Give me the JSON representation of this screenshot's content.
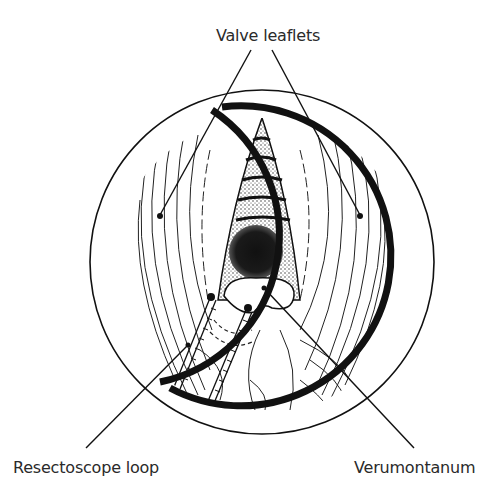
{
  "figure": {
    "type": "endoscopic view illustration",
    "labels": {
      "top": "Valve leaflets",
      "bottom_left": "Resectoscope loop",
      "bottom_right": "Verumontanum"
    },
    "colors": {
      "ink": "#111111",
      "background": "#ffffff",
      "label_text": "#2a2a2a"
    }
  }
}
